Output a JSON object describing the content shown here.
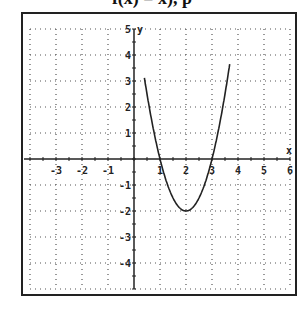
{
  "header": {
    "clipped_text": "f(x) = x), p"
  },
  "chart_data": {
    "type": "line",
    "title": "",
    "xlabel": "x",
    "ylabel": "y",
    "xlim": [
      -4,
      6
    ],
    "ylim": [
      -5,
      5
    ],
    "grid": true,
    "x_ticks": [
      -3,
      -2,
      -1,
      1,
      2,
      3,
      4,
      5,
      6
    ],
    "y_ticks": [
      -4,
      -3,
      -2,
      -1,
      1,
      2,
      3,
      4,
      5
    ],
    "series": [
      {
        "name": "parabola",
        "equation": "y = 2(x-2)^2 - 2",
        "vertex": [
          2,
          -2
        ],
        "x_intercepts": [
          1,
          3
        ],
        "points": [
          [
            0.6,
            1.92
          ],
          [
            1,
            0
          ],
          [
            1.5,
            -1.5
          ],
          [
            2,
            -2
          ],
          [
            2.5,
            -1.5
          ],
          [
            3,
            0
          ],
          [
            3.5,
            2.5
          ],
          [
            3.75,
            4.125
          ]
        ]
      }
    ]
  }
}
